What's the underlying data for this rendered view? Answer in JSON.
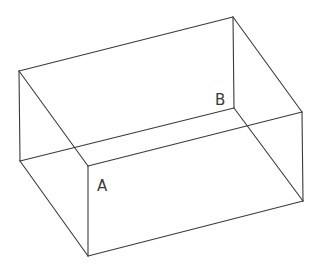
{
  "diagram": {
    "type": "rectangular-prism-wireframe",
    "stroke_color": "#3a3a3a",
    "background": "#ffffff",
    "vertices": {
      "back_top_left": [
        19,
        71
      ],
      "back_top_right": [
        233,
        17
      ],
      "front_top_right": [
        302,
        112
      ],
      "front_top_left": [
        88,
        166
      ],
      "back_bottom_left": [
        20,
        161
      ],
      "back_bottom_right": [
        234,
        108
      ],
      "front_bottom_right": [
        303,
        201
      ],
      "front_bottom_left": [
        88,
        256
      ]
    },
    "edges": [
      [
        "back_top_left",
        "back_top_right"
      ],
      [
        "back_top_right",
        "front_top_right"
      ],
      [
        "front_top_right",
        "front_top_left"
      ],
      [
        "front_top_left",
        "back_top_left"
      ],
      [
        "back_bottom_left",
        "back_bottom_right"
      ],
      [
        "back_bottom_right",
        "front_bottom_right"
      ],
      [
        "front_bottom_right",
        "front_bottom_left"
      ],
      [
        "front_bottom_left",
        "back_bottom_left"
      ],
      [
        "back_top_left",
        "back_bottom_left"
      ],
      [
        "back_top_right",
        "back_bottom_right"
      ],
      [
        "front_top_right",
        "front_bottom_right"
      ],
      [
        "front_top_left",
        "front_bottom_left"
      ]
    ],
    "labels": [
      {
        "id": "label-a",
        "text": "A",
        "x": 97,
        "y": 191
      },
      {
        "id": "label-b",
        "text": "B",
        "x": 215,
        "y": 105
      }
    ]
  }
}
